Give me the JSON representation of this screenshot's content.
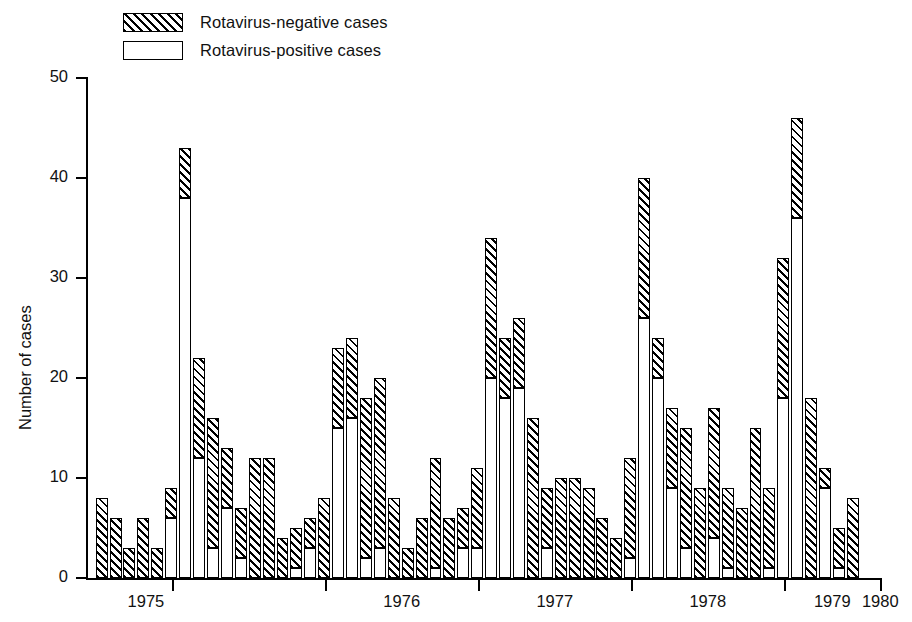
{
  "legend": {
    "items": [
      {
        "label": "Rotavirus-negative cases",
        "swatch": "hatched",
        "color": "#000000"
      },
      {
        "label": "Rotavirus-positive cases",
        "swatch": "open",
        "color": "#ffffff"
      }
    ]
  },
  "axes": {
    "ylabel": "Number of cases",
    "yticks": [
      "0",
      "10",
      "20",
      "30",
      "40",
      "50"
    ],
    "xticklabels": [
      "1975",
      "1976",
      "1977",
      "1978",
      "1979",
      "1980"
    ]
  },
  "chart_data": {
    "type": "bar",
    "title": "",
    "subtitle": "",
    "xlabel": "",
    "ylabel": "Number of cases",
    "ylim": [
      0,
      50
    ],
    "yticks": [
      0,
      10,
      20,
      30,
      40,
      50
    ],
    "grid": false,
    "stacked": true,
    "legend_position": "top-left",
    "bar_count": 61,
    "x_tick_values": [
      1975,
      1976,
      1977,
      1978,
      1979,
      1980
    ],
    "categories": [
      "1974-11",
      "1974-12",
      "1975-01",
      "1975-02",
      "1975-03",
      "1975-04",
      "1975-05",
      "1975-06",
      "1975-07",
      "1975-08",
      "1975-09",
      "1975-10",
      "1975-11",
      "1975-12",
      "1976-01",
      "1976-02",
      "1976-03",
      "1976-04",
      "1976-05",
      "1976-06",
      "1976-07",
      "1976-08",
      "1976-09",
      "1976-10",
      "1976-11",
      "1976-12",
      "1977-01",
      "1977-02",
      "1977-03",
      "1977-04",
      "1977-05",
      "1977-06",
      "1977-07",
      "1977-08",
      "1977-09",
      "1977-10",
      "1977-11",
      "1977-12",
      "1978-01",
      "1978-02",
      "1978-03",
      "1978-04",
      "1978-05",
      "1978-06",
      "1978-07",
      "1978-08",
      "1978-09",
      "1978-10",
      "1978-11",
      "1978-12",
      "1979-01",
      "1979-02",
      "1979-03",
      "1979-04",
      "1979-05",
      "1979-06",
      "1979-07",
      "1979-08",
      "1979-09",
      "1979-10",
      "1979-11"
    ],
    "series": [
      {
        "name": "Rotavirus-positive cases",
        "color": "#ffffff",
        "pattern": "open",
        "values": [
          0,
          0,
          0,
          0,
          0,
          6,
          38,
          12,
          3,
          7,
          2,
          0,
          0,
          0,
          1,
          3,
          15,
          16,
          16,
          3,
          2,
          0,
          0,
          0,
          0,
          1,
          3,
          0,
          0,
          0,
          20,
          18,
          19,
          0,
          0,
          0,
          0,
          0,
          0,
          0,
          0,
          2,
          26,
          20,
          9,
          3,
          0,
          0,
          4,
          1,
          9,
          1,
          18,
          36,
          9,
          1,
          0,
          0,
          0,
          0,
          0
        ]
      },
      {
        "name": "Rotavirus-negative cases",
        "color": "#000000",
        "pattern": "hatched",
        "values": [
          8,
          6,
          3,
          6,
          3,
          3,
          5,
          10,
          13,
          6,
          5,
          12,
          12,
          4,
          4,
          3,
          8,
          8,
          8,
          15,
          10,
          8,
          3,
          6,
          12,
          5,
          4,
          11,
          34,
          24,
          6,
          8,
          7,
          16,
          10,
          10,
          9,
          6,
          4,
          12,
          40,
          24,
          0,
          4,
          8,
          14,
          17,
          9,
          5,
          16,
          8,
          14,
          14,
          10,
          9,
          10,
          5,
          0,
          0,
          0,
          0
        ]
      }
    ],
    "totals": [
      8,
      6,
      3,
      6,
      3,
      9,
      43,
      22,
      16,
      13,
      7,
      12,
      12,
      4,
      5,
      6,
      23,
      24,
      24,
      18,
      12,
      8,
      3,
      6,
      12,
      6,
      7,
      11,
      34,
      24,
      26,
      26,
      26,
      16,
      10,
      10,
      9,
      6,
      4,
      12,
      40,
      26,
      26,
      24,
      17,
      17,
      17,
      9,
      9,
      17,
      17,
      15,
      32,
      46,
      18,
      11,
      5,
      0,
      0,
      0,
      0
    ]
  },
  "bars": [
    {
      "pos": 0,
      "neg": 8,
      "total": 8
    },
    {
      "pos": 0,
      "neg": 6,
      "total": 6
    },
    {
      "pos": 0,
      "neg": 3,
      "total": 3
    },
    {
      "pos": 0,
      "neg": 6,
      "total": 6
    },
    {
      "pos": 0,
      "neg": 3,
      "total": 3
    },
    {
      "pos": 6,
      "neg": 3,
      "total": 9
    },
    {
      "pos": 38,
      "neg": 5,
      "total": 43
    },
    {
      "pos": 12,
      "neg": 10,
      "total": 22
    },
    {
      "pos": 3,
      "neg": 13,
      "total": 16
    },
    {
      "pos": 7,
      "neg": 6,
      "total": 13
    },
    {
      "pos": 2,
      "neg": 5,
      "total": 7
    },
    {
      "pos": 0,
      "neg": 12,
      "total": 12
    },
    {
      "pos": 0,
      "neg": 12,
      "total": 12
    },
    {
      "pos": 0,
      "neg": 4,
      "total": 4
    },
    {
      "pos": 1,
      "neg": 4,
      "total": 5
    },
    {
      "pos": 3,
      "neg": 3,
      "total": 6
    },
    {
      "pos": 0,
      "neg": 8,
      "total": 8
    },
    {
      "pos": 15,
      "neg": 8,
      "total": 23
    },
    {
      "pos": 16,
      "neg": 8,
      "total": 24
    },
    {
      "pos": 2,
      "neg": 16,
      "total": 18
    },
    {
      "pos": 3,
      "neg": 17,
      "total": 20
    },
    {
      "pos": 0,
      "neg": 8,
      "total": 8
    },
    {
      "pos": 0,
      "neg": 3,
      "total": 3
    },
    {
      "pos": 0,
      "neg": 6,
      "total": 6
    },
    {
      "pos": 1,
      "neg": 11,
      "total": 12
    },
    {
      "pos": 0,
      "neg": 6,
      "total": 6
    },
    {
      "pos": 3,
      "neg": 4,
      "total": 7
    },
    {
      "pos": 3,
      "neg": 8,
      "total": 11
    },
    {
      "pos": 20,
      "neg": 14,
      "total": 34
    },
    {
      "pos": 18,
      "neg": 6,
      "total": 24
    },
    {
      "pos": 19,
      "neg": 7,
      "total": 26
    },
    {
      "pos": 0,
      "neg": 16,
      "total": 16
    },
    {
      "pos": 3,
      "neg": 6,
      "total": 9
    },
    {
      "pos": 0,
      "neg": 10,
      "total": 10
    },
    {
      "pos": 0,
      "neg": 10,
      "total": 10
    },
    {
      "pos": 0,
      "neg": 9,
      "total": 9
    },
    {
      "pos": 0,
      "neg": 6,
      "total": 6
    },
    {
      "pos": 0,
      "neg": 4,
      "total": 4
    },
    {
      "pos": 2,
      "neg": 10,
      "total": 12
    },
    {
      "pos": 26,
      "neg": 14,
      "total": 40
    },
    {
      "pos": 20,
      "neg": 4,
      "total": 24
    },
    {
      "pos": 9,
      "neg": 8,
      "total": 17
    },
    {
      "pos": 3,
      "neg": 12,
      "total": 15
    },
    {
      "pos": 0,
      "neg": 9,
      "total": 9
    },
    {
      "pos": 4,
      "neg": 13,
      "total": 17
    },
    {
      "pos": 1,
      "neg": 8,
      "total": 9
    },
    {
      "pos": 0,
      "neg": 7,
      "total": 7
    },
    {
      "pos": 0,
      "neg": 15,
      "total": 15
    },
    {
      "pos": 1,
      "neg": 8,
      "total": 9
    },
    {
      "pos": 18,
      "neg": 14,
      "total": 32
    },
    {
      "pos": 36,
      "neg": 10,
      "total": 46
    },
    {
      "pos": 0,
      "neg": 18,
      "total": 18
    },
    {
      "pos": 9,
      "neg": 2,
      "total": 11
    },
    {
      "pos": 1,
      "neg": 4,
      "total": 5
    },
    {
      "pos": 0,
      "neg": 8,
      "total": 8
    }
  ]
}
